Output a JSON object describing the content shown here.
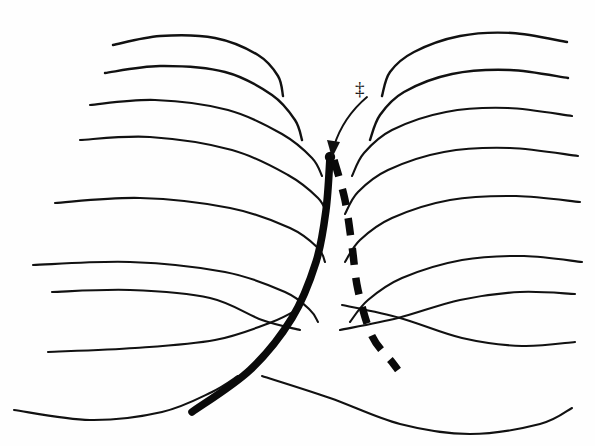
{
  "figure": {
    "background_color": "#fefefe",
    "stroke_color": "#111111",
    "width": 595,
    "height": 446
  },
  "annotations": {
    "transition_state_symbol": "‡",
    "transition_state_meaning": "transition state (saddle point)",
    "pointer_arrow_name": "arrow-to-saddle-point"
  },
  "paths": {
    "solid_label": "reaction path (solid)",
    "dashed_label": "alternative path (dashed)"
  },
  "chart_data": {
    "type": "line",
    "xlabel": "",
    "ylabel": "",
    "grid": false,
    "legend_position": "none",
    "xlim": [
      0,
      595
    ],
    "ylim": [
      0,
      446
    ],
    "series": [
      {
        "name": "left-peak-contour-1",
        "group": "left-peak",
        "level": 1,
        "points": [
          [
            113,
            45
          ],
          [
            160,
            36
          ],
          [
            215,
            38
          ],
          [
            258,
            55
          ],
          [
            278,
            76
          ],
          [
            283,
            96
          ]
        ]
      },
      {
        "name": "left-peak-contour-2",
        "group": "left-peak",
        "level": 2,
        "points": [
          [
            105,
            73
          ],
          [
            160,
            66
          ],
          [
            225,
            72
          ],
          [
            272,
            95
          ],
          [
            295,
            120
          ],
          [
            302,
            140
          ]
        ]
      },
      {
        "name": "left-peak-contour-3",
        "group": "left-peak",
        "level": 3,
        "points": [
          [
            90,
            105
          ],
          [
            155,
            100
          ],
          [
            228,
            110
          ],
          [
            282,
            134
          ],
          [
            312,
            158
          ],
          [
            322,
            176
          ]
        ]
      },
      {
        "name": "left-peak-contour-4",
        "group": "left-peak",
        "level": 4,
        "points": [
          [
            80,
            140
          ],
          [
            150,
            137
          ],
          [
            232,
            150
          ],
          [
            288,
            175
          ],
          [
            318,
            198
          ],
          [
            327,
            214
          ]
        ]
      },
      {
        "name": "left-peak-contour-5",
        "group": "left-peak",
        "level": 5,
        "points": [
          [
            55,
            203
          ],
          [
            140,
            198
          ],
          [
            230,
            208
          ],
          [
            290,
            228
          ],
          [
            318,
            248
          ],
          [
            325,
            262
          ]
        ]
      },
      {
        "name": "left-peak-contour-6",
        "group": "left-peak",
        "level": 6,
        "points": [
          [
            33,
            265
          ],
          [
            130,
            262
          ],
          [
            225,
            272
          ],
          [
            285,
            292
          ],
          [
            310,
            310
          ],
          [
            318,
            322
          ]
        ]
      },
      {
        "name": "right-peak-contour-1",
        "group": "right-peak",
        "level": 1,
        "points": [
          [
            382,
            96
          ],
          [
            390,
            72
          ],
          [
            414,
            52
          ],
          [
            460,
            36
          ],
          [
            512,
            33
          ],
          [
            567,
            42
          ]
        ]
      },
      {
        "name": "right-peak-contour-2",
        "group": "right-peak",
        "level": 2,
        "points": [
          [
            370,
            140
          ],
          [
            380,
            115
          ],
          [
            404,
            92
          ],
          [
            452,
            74
          ],
          [
            510,
            70
          ],
          [
            568,
            78
          ]
        ]
      },
      {
        "name": "right-peak-contour-3",
        "group": "right-peak",
        "level": 3,
        "points": [
          [
            352,
            176
          ],
          [
            364,
            153
          ],
          [
            392,
            130
          ],
          [
            446,
            112
          ],
          [
            508,
            108
          ],
          [
            572,
            116
          ]
        ]
      },
      {
        "name": "right-peak-contour-4",
        "group": "right-peak",
        "level": 4,
        "points": [
          [
            345,
            214
          ],
          [
            358,
            192
          ],
          [
            388,
            170
          ],
          [
            444,
            152
          ],
          [
            510,
            148
          ],
          [
            578,
            156
          ]
        ]
      },
      {
        "name": "right-peak-contour-5",
        "group": "right-peak",
        "level": 5,
        "points": [
          [
            345,
            262
          ],
          [
            360,
            240
          ],
          [
            392,
            218
          ],
          [
            450,
            200
          ],
          [
            516,
            196
          ],
          [
            580,
            202
          ]
        ]
      },
      {
        "name": "right-peak-contour-6",
        "group": "right-peak",
        "level": 6,
        "points": [
          [
            350,
            322
          ],
          [
            368,
            300
          ],
          [
            402,
            278
          ],
          [
            462,
            260
          ],
          [
            524,
            256
          ],
          [
            582,
            262
          ]
        ]
      },
      {
        "name": "valley-contour-a-left",
        "group": "valley",
        "level": 7,
        "points": [
          [
            52,
            292
          ],
          [
            130,
            290
          ],
          [
            210,
            298
          ],
          [
            262,
            320
          ],
          [
            300,
            330
          ]
        ]
      },
      {
        "name": "valley-contour-a-right",
        "group": "valley",
        "level": 7,
        "points": [
          [
            340,
            330
          ],
          [
            398,
            318
          ],
          [
            460,
            300
          ],
          [
            520,
            292
          ],
          [
            575,
            294
          ]
        ]
      },
      {
        "name": "valley-contour-b-left",
        "group": "valley",
        "level": 8,
        "points": [
          [
            48,
            352
          ],
          [
            135,
            348
          ],
          [
            215,
            340
          ],
          [
            272,
            322
          ],
          [
            300,
            308
          ]
        ]
      },
      {
        "name": "valley-contour-b-right",
        "group": "valley",
        "level": 8,
        "points": [
          [
            342,
            305
          ],
          [
            400,
            318
          ],
          [
            462,
            338
          ],
          [
            522,
            346
          ],
          [
            575,
            342
          ]
        ]
      },
      {
        "name": "valley-contour-c-left",
        "group": "valley",
        "level": 9,
        "points": [
          [
            14,
            410
          ],
          [
            90,
            420
          ],
          [
            162,
            412
          ],
          [
            212,
            392
          ],
          [
            238,
            376
          ]
        ]
      },
      {
        "name": "valley-contour-c-right",
        "group": "valley",
        "level": 9,
        "points": [
          [
            262,
            376
          ],
          [
            330,
            398
          ],
          [
            400,
            424
          ],
          [
            470,
            434
          ],
          [
            540,
            424
          ],
          [
            572,
            408
          ]
        ]
      },
      {
        "name": "reaction-path-solid",
        "group": "path",
        "style": "solid",
        "points": [
          [
            330,
            157
          ],
          [
            326,
            210
          ],
          [
            316,
            262
          ],
          [
            292,
            318
          ],
          [
            250,
            370
          ],
          [
            192,
            412
          ]
        ]
      },
      {
        "name": "reaction-path-dashed",
        "group": "path",
        "style": "dashed",
        "points": [
          [
            334,
            160
          ],
          [
            345,
            200
          ],
          [
            352,
            246
          ],
          [
            358,
            290
          ],
          [
            372,
            336
          ],
          [
            392,
            362
          ],
          [
            398,
            370
          ]
        ]
      },
      {
        "name": "pointer-arrow",
        "group": "annotation",
        "style": "thin",
        "points": [
          [
            366,
            98
          ],
          [
            352,
            112
          ],
          [
            340,
            132
          ],
          [
            333,
            150
          ]
        ]
      }
    ],
    "markers": [
      {
        "name": "saddle-point",
        "x": 330,
        "y": 157,
        "label": "‡"
      }
    ],
    "annotations": [
      {
        "text": "‡",
        "x": 362,
        "y": 90,
        "meaning": "transition state"
      }
    ]
  }
}
